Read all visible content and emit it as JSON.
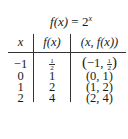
{
  "table": {
    "title": {
      "lhs": "f(x)",
      "eq": " = ",
      "base": "2",
      "exp": "x"
    },
    "headers": [
      "x",
      "f(x)",
      "(x, f(x))"
    ],
    "rows": [
      {
        "x": "−1",
        "fx_num": "1",
        "fx_den": "2",
        "pair_pre": "−1, ",
        "pair_num": "1",
        "pair_den": "2"
      },
      {
        "x": "0",
        "fx": "1",
        "pair": "(0, 1)"
      },
      {
        "x": "1",
        "fx": "2",
        "pair": "(1, 2)"
      },
      {
        "x": "2",
        "fx": "4",
        "pair": "(2, 4)"
      }
    ]
  }
}
